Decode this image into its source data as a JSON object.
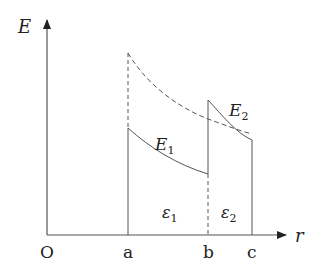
{
  "diagram": {
    "type": "field-vs-radius",
    "axes": {
      "y_label": "E",
      "x_label": "r",
      "origin_label": "O"
    },
    "ticks": {
      "a": "a",
      "b": "b",
      "c": "c"
    },
    "curves": {
      "E1": {
        "label_main": "E",
        "label_sub": "1"
      },
      "E2": {
        "label_main": "E",
        "label_sub": "2"
      }
    },
    "regions": {
      "eps1": {
        "label_main": "ε",
        "label_sub": "1"
      },
      "eps2": {
        "label_main": "ε",
        "label_sub": "2"
      }
    },
    "colors": {
      "line": "#555555",
      "text": "#222222",
      "background": "#ffffff"
    }
  }
}
